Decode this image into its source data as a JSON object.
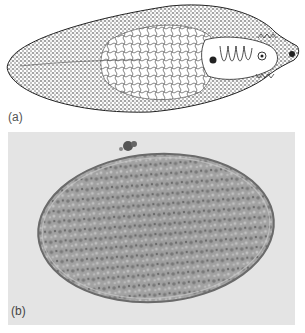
{
  "figure": {
    "panels": [
      {
        "label": "(a)",
        "content": "line drawing of liver fluke (flatworm) showing branched internal organs and coiled uterus near anterior end"
      },
      {
        "label": "(b)",
        "content": "light micrograph of oval granular egg on grey background"
      }
    ],
    "colors": {
      "drawing_ink": "#222222",
      "photo_background": "#e4e4e4",
      "egg_fill": "#9a9a9a",
      "egg_shell": "#6a6a6a"
    }
  }
}
